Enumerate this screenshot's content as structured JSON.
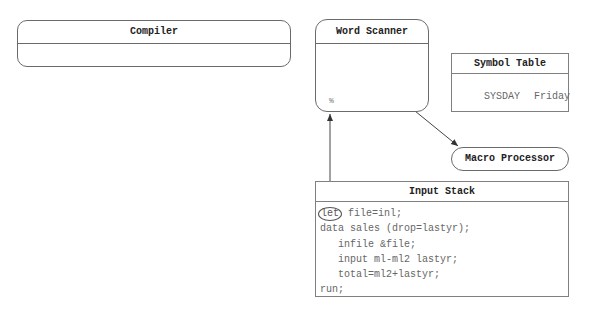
{
  "compiler": {
    "title": "Compiler"
  },
  "word_scanner": {
    "title": "Word Scanner",
    "token": "%"
  },
  "symbol_table": {
    "title": "Symbol Table",
    "entries": [
      {
        "name": "SYSDAY",
        "value": "Friday"
      }
    ]
  },
  "macro_processor": {
    "title": "Macro Processor"
  },
  "input_stack": {
    "title": "Input Stack",
    "highlighted_token": "let",
    "lines": [
      " file=inl;",
      "data sales (drop=lastyr);",
      "infile &file;",
      "input ml-ml2 lastyr;",
      "total=ml2+lastyr;",
      "run;"
    ]
  },
  "colors": {
    "border": "#6a6a6a",
    "text": "#2a2a2a",
    "code_text": "#666666"
  }
}
